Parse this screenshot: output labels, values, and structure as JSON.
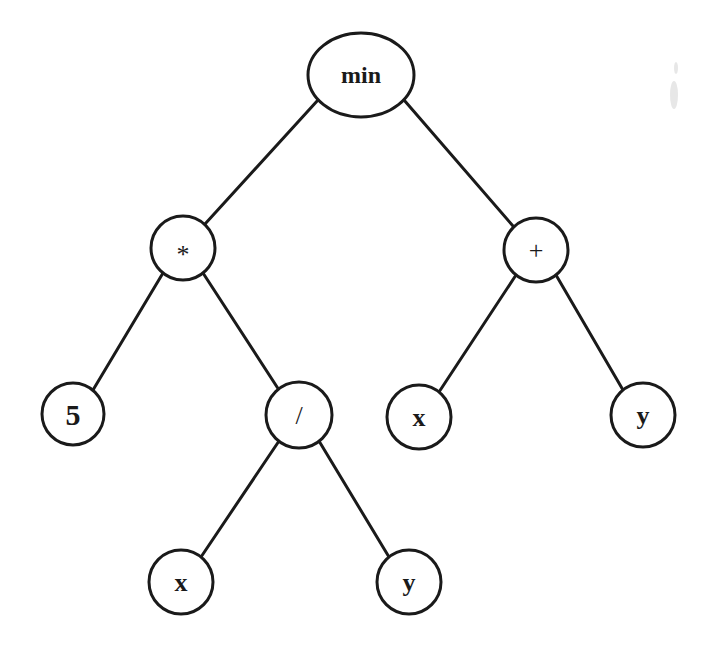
{
  "diagram": {
    "type": "expression-tree",
    "expression": "min(5 * (x / y), x + y)",
    "root": "min",
    "nodes": [
      {
        "id": "n-min",
        "label": "min",
        "shape": "ellipse",
        "cx": 361,
        "cy": 75,
        "rx": 53,
        "ry": 42,
        "font_size": 24,
        "kind": "function"
      },
      {
        "id": "n-mul",
        "label": "*",
        "shape": "circle",
        "cx": 183,
        "cy": 248,
        "r": 32,
        "font_size": 26,
        "kind": "operator"
      },
      {
        "id": "n-add",
        "label": "+",
        "shape": "circle",
        "cx": 536,
        "cy": 250,
        "r": 32,
        "font_size": 26,
        "kind": "operator"
      },
      {
        "id": "n-five",
        "label": "5",
        "shape": "circle",
        "cx": 73,
        "cy": 414,
        "r": 31,
        "font_size": 30,
        "kind": "constant"
      },
      {
        "id": "n-div",
        "label": "/",
        "shape": "circle",
        "cx": 299,
        "cy": 415,
        "r": 33,
        "font_size": 26,
        "kind": "operator"
      },
      {
        "id": "n-x1",
        "label": "x",
        "shape": "circle",
        "cx": 419,
        "cy": 417,
        "r": 32,
        "font_size": 26,
        "kind": "variable"
      },
      {
        "id": "n-y1",
        "label": "y",
        "shape": "circle",
        "cx": 643,
        "cy": 415,
        "r": 32,
        "font_size": 26,
        "kind": "variable"
      },
      {
        "id": "n-x2",
        "label": "x",
        "shape": "circle",
        "cx": 181,
        "cy": 582,
        "r": 32,
        "font_size": 26,
        "kind": "variable"
      },
      {
        "id": "n-y2",
        "label": "y",
        "shape": "circle",
        "cx": 409,
        "cy": 582,
        "r": 32,
        "font_size": 26,
        "kind": "variable"
      }
    ],
    "edges": [
      {
        "from": "n-min",
        "to": "n-mul",
        "x1": 318,
        "y1": 100,
        "x2": 205,
        "y2": 224
      },
      {
        "from": "n-min",
        "to": "n-add",
        "x1": 404,
        "y1": 100,
        "x2": 513,
        "y2": 226
      },
      {
        "from": "n-mul",
        "to": "n-five",
        "x1": 163,
        "y1": 273,
        "x2": 93,
        "y2": 390
      },
      {
        "from": "n-mul",
        "to": "n-div",
        "x1": 203,
        "y1": 273,
        "x2": 279,
        "y2": 390
      },
      {
        "from": "n-add",
        "to": "n-x1",
        "x1": 516,
        "y1": 275,
        "x2": 439,
        "y2": 392
      },
      {
        "from": "n-add",
        "to": "n-y1",
        "x1": 556,
        "y1": 275,
        "x2": 623,
        "y2": 390
      },
      {
        "from": "n-div",
        "to": "n-x2",
        "x1": 279,
        "y1": 441,
        "x2": 201,
        "y2": 557
      },
      {
        "from": "n-div",
        "to": "n-y2",
        "x1": 319,
        "y1": 441,
        "x2": 389,
        "y2": 557
      }
    ],
    "colors": {
      "stroke": "#1a1a1a",
      "fill": "#ffffff",
      "background": "#ffffff"
    }
  }
}
